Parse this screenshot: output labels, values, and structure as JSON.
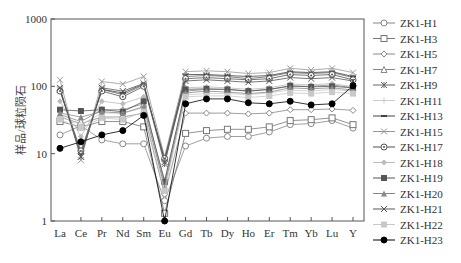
{
  "chart_data": {
    "type": "line",
    "title": "",
    "xlabel": "",
    "ylabel": "样品/球粒陨石",
    "yscale": "log",
    "ylim": [
      1,
      1000
    ],
    "yticks": [
      "1",
      "10",
      "100",
      "1000"
    ],
    "grid": false,
    "legend_position": "right",
    "categories": [
      "La",
      "Ce",
      "Pr",
      "Nd",
      "Sm",
      "Eu",
      "Gd",
      "Tb",
      "Dy",
      "Ho",
      "Er",
      "Tm",
      "Yb",
      "Lu",
      "Y"
    ],
    "series": [
      {
        "name": "ZK1-H1",
        "marker": "circle-open",
        "color": "#888888",
        "values": [
          19,
          26,
          16,
          14,
          14,
          2.0,
          13,
          17,
          18,
          18,
          21,
          27,
          28,
          31,
          24
        ]
      },
      {
        "name": "ZK1-H3",
        "marker": "square-open",
        "color": "#777777",
        "values": [
          30,
          25,
          30,
          30,
          25,
          1.3,
          20,
          22,
          23,
          23,
          25,
          31,
          32,
          34,
          27
        ]
      },
      {
        "name": "ZK1-H5",
        "marker": "diamond-open",
        "color": "#888888",
        "values": [
          35,
          28,
          35,
          35,
          40,
          2.5,
          40,
          40,
          40,
          39,
          40,
          45,
          45,
          46,
          44
        ]
      },
      {
        "name": "ZK1-H7",
        "marker": "triangle-open",
        "color": "#888888",
        "values": [
          38,
          30,
          45,
          45,
          55,
          4.0,
          85,
          90,
          90,
          85,
          90,
          100,
          100,
          105,
          95
        ]
      },
      {
        "name": "ZK1-H9",
        "marker": "star",
        "color": "#666666",
        "values": [
          90,
          9,
          90,
          75,
          105,
          7.0,
          140,
          145,
          140,
          130,
          140,
          160,
          155,
          160,
          135
        ]
      },
      {
        "name": "ZK1-H11",
        "marker": "plus",
        "color": "#cccccc",
        "values": [
          35,
          27,
          40,
          40,
          48,
          3.5,
          75,
          78,
          78,
          75,
          80,
          88,
          85,
          90,
          85
        ]
      },
      {
        "name": "ZK1-H13",
        "marker": "dash",
        "color": "#444444",
        "values": [
          88,
          10,
          90,
          80,
          108,
          8.0,
          150,
          150,
          145,
          140,
          145,
          165,
          160,
          165,
          140
        ]
      },
      {
        "name": "ZK1-H15",
        "marker": "x",
        "color": "#999999",
        "values": [
          125,
          8,
          118,
          108,
          140,
          9.0,
          165,
          170,
          165,
          155,
          160,
          185,
          175,
          185,
          160
        ]
      },
      {
        "name": "ZK1-H17",
        "marker": "circle-dot",
        "color": "#555555",
        "values": [
          85,
          11,
          85,
          70,
          100,
          8.5,
          130,
          135,
          130,
          125,
          130,
          150,
          145,
          150,
          125
        ]
      },
      {
        "name": "ZK1-H18",
        "marker": "diamond",
        "color": "#bbbbbb",
        "values": [
          60,
          18,
          60,
          55,
          70,
          3.0,
          95,
          98,
          95,
          90,
          95,
          108,
          105,
          110,
          98
        ]
      },
      {
        "name": "ZK1-H19",
        "marker": "square",
        "color": "#555555",
        "values": [
          45,
          43,
          45,
          42,
          60,
          3.8,
          90,
          92,
          90,
          85,
          90,
          102,
          98,
          100,
          95
        ]
      },
      {
        "name": "ZK1-H20",
        "marker": "triangle",
        "color": "#888888",
        "values": [
          40,
          35,
          42,
          40,
          50,
          3.2,
          80,
          85,
          82,
          78,
          82,
          95,
          92,
          95,
          88
        ]
      },
      {
        "name": "ZK1-H21",
        "marker": "x",
        "color": "#555555",
        "values": [
          95,
          9,
          95,
          85,
          110,
          7.5,
          120,
          125,
          120,
          115,
          120,
          135,
          130,
          135,
          120
        ]
      },
      {
        "name": "ZK1-H22",
        "marker": "square",
        "color": "#c8c8c8",
        "values": [
          32,
          24,
          34,
          32,
          42,
          2.8,
          70,
          72,
          72,
          68,
          72,
          80,
          78,
          82,
          78
        ]
      },
      {
        "name": "ZK1-H23",
        "marker": "circle",
        "color": "#000000",
        "values": [
          12,
          15,
          19,
          22,
          37,
          1.0,
          55,
          65,
          65,
          57,
          55,
          60,
          53,
          55,
          102
        ]
      }
    ]
  }
}
